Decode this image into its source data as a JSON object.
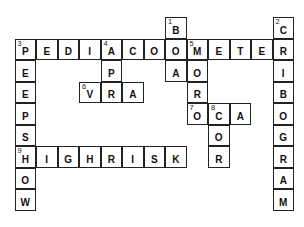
{
  "puzzle": {
    "type": "crossword",
    "grid": {
      "origin_x": 15,
      "origin_y": 17.5,
      "cell_size": 21.5
    },
    "words": [
      {
        "number": 1,
        "direction": "down",
        "answer": "BOA",
        "row": 0,
        "col": 7
      },
      {
        "number": 2,
        "direction": "down",
        "answer": "CRIBOGRAM",
        "row": 0,
        "col": 12
      },
      {
        "number": 3,
        "direction": "across",
        "answer": "PEDIACOUMETER",
        "row": 1,
        "col": 0
      },
      {
        "number": 3,
        "direction": "down",
        "answer": "PEEPSHOW",
        "row": 1,
        "col": 0
      },
      {
        "number": 4,
        "direction": "down",
        "answer": "APR",
        "row": 1,
        "col": 4
      },
      {
        "number": 5,
        "direction": "down",
        "answer": "MORO",
        "row": 1,
        "col": 8
      },
      {
        "number": 6,
        "direction": "across",
        "answer": "VRA",
        "row": 3,
        "col": 3
      },
      {
        "number": 7,
        "direction": "across",
        "answer": "OCA",
        "row": 4,
        "col": 8
      },
      {
        "number": 8,
        "direction": "down",
        "answer": "COR",
        "row": 4,
        "col": 9
      },
      {
        "number": 9,
        "direction": "across",
        "answer": "HIGHRISK",
        "row": 6,
        "col": 0
      }
    ]
  }
}
